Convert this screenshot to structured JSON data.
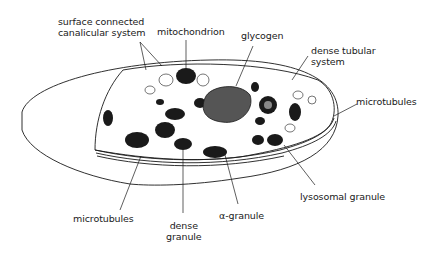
{
  "diagram": {
    "labels": {
      "surface_connected_1": "surface connected",
      "surface_connected_2": "canalicular system",
      "mitochondrion": "mitochondrion",
      "glycogen": "glycogen",
      "dense_tubular_1": "dense tubular",
      "dense_tubular_2": "system",
      "microtubules_right": "microtubules",
      "lysosomal_granule": "lysosomal granule",
      "alpha_granule": "α-granule",
      "dense_granule_1": "dense",
      "dense_granule_2": "granule",
      "microtubules_left": "microtubules"
    },
    "colors": {
      "ink": "#1a1a1a",
      "background": "#ffffff"
    }
  }
}
